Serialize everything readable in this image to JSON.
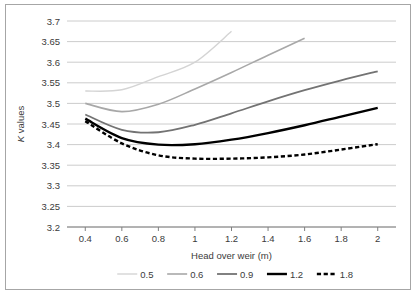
{
  "figure": {
    "background_color": "#ffffff",
    "frame_color": "#a6a6a6",
    "gridline_color": "#bfbfbf",
    "text_color": "#3b3b3b"
  },
  "chart_data": {
    "type": "line",
    "title": "",
    "xlabel": "Head over weir (m)",
    "ylabel": "K values",
    "xlim": [
      0.3,
      2.1
    ],
    "ylim": [
      3.2,
      3.7
    ],
    "xticks": [
      "0.4",
      "0.6",
      "0.8",
      "1",
      "1.2",
      "1.4",
      "1.6",
      "1.8",
      "2"
    ],
    "xtick_values": [
      0.4,
      0.6,
      0.8,
      1.0,
      1.2,
      1.4,
      1.6,
      1.8,
      2.0
    ],
    "yticks": [
      "3.2",
      "3.25",
      "3.3",
      "3.35",
      "3.4",
      "3.45",
      "3.5",
      "3.55",
      "3.6",
      "3.65",
      "3.7"
    ],
    "ytick_values": [
      3.2,
      3.25,
      3.3,
      3.35,
      3.4,
      3.45,
      3.5,
      3.55,
      3.6,
      3.65,
      3.7
    ],
    "grid": true,
    "grid_axis": "y",
    "legend_position": "bottom",
    "legend_title": "",
    "series": [
      {
        "name": "0.5",
        "color": "#d4d4d4",
        "width": 1.4,
        "dash": "none",
        "x": [
          0.4,
          0.6,
          0.8,
          1.0,
          1.2
        ],
        "values": [
          3.53,
          3.533,
          3.565,
          3.6,
          3.675
        ]
      },
      {
        "name": "0.6",
        "color": "#a8a8a8",
        "width": 1.6,
        "dash": "none",
        "x": [
          0.4,
          0.6,
          0.8,
          1.0,
          1.2,
          1.4,
          1.6
        ],
        "values": [
          3.5,
          3.48,
          3.498,
          3.535,
          3.575,
          3.617,
          3.658
        ]
      },
      {
        "name": "0.9",
        "color": "#737373",
        "width": 1.8,
        "dash": "none",
        "x": [
          0.4,
          0.6,
          0.8,
          1.0,
          1.2,
          1.4,
          1.6,
          1.8,
          2.0
        ],
        "values": [
          3.473,
          3.436,
          3.43,
          3.448,
          3.476,
          3.505,
          3.532,
          3.556,
          3.578
        ]
      },
      {
        "name": "1.2",
        "color": "#000000",
        "width": 2.4,
        "dash": "none",
        "x": [
          0.4,
          0.6,
          0.8,
          1.0,
          1.2,
          1.4,
          1.6,
          1.8,
          2.0
        ],
        "values": [
          3.463,
          3.416,
          3.4,
          3.401,
          3.412,
          3.428,
          3.447,
          3.468,
          3.489
        ]
      },
      {
        "name": "1.8",
        "color": "#000000",
        "width": 2.4,
        "dash": "dashed",
        "x": [
          0.4,
          0.6,
          0.8,
          1.0,
          1.2,
          1.4,
          1.6,
          1.8,
          2.0
        ],
        "values": [
          3.457,
          3.403,
          3.374,
          3.366,
          3.366,
          3.369,
          3.376,
          3.388,
          3.401
        ]
      }
    ]
  }
}
